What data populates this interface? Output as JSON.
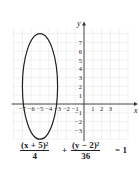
{
  "chart_data": {
    "type": "line",
    "title": "",
    "equation": "(x + 5)^2/4 + (y - 2)^2/36 = 1",
    "xlabel": "x",
    "ylabel": "y",
    "xlim": [
      -8,
      5
    ],
    "ylim": [
      -4,
      8
    ],
    "grid": true,
    "x_ticks": [
      -7,
      -6,
      -5,
      -4,
      -3,
      -2,
      -1,
      1,
      2,
      3
    ],
    "x_tick_labels": [
      "−7",
      "−6",
      "−5",
      "−4",
      "−3",
      "−2",
      "−1",
      "1",
      "2",
      "3"
    ],
    "y_ticks": [
      7,
      6,
      5,
      4,
      3,
      2,
      1,
      -1,
      -2,
      -3
    ],
    "y_tick_labels": [
      "7",
      "6",
      "5",
      "4",
      "3",
      "2",
      "1",
      "−1",
      "−2",
      "−3"
    ],
    "series": [
      {
        "name": "ellipse",
        "shape": "ellipse",
        "center": [
          -5,
          2
        ],
        "semi_axis_x": 2,
        "semi_axis_y": 6,
        "vertices": [
          [
            -5,
            8
          ],
          [
            -5,
            -4
          ]
        ],
        "co_vertices": [
          [
            -7,
            2
          ],
          [
            -3,
            2
          ]
        ],
        "color": "#222222"
      }
    ]
  },
  "equation": {
    "left_num": "(x + 5)²",
    "left_den": "4",
    "plus": "+",
    "right_num": "(y − 2)²",
    "right_den": "36",
    "equals": "= 1"
  },
  "axes": {
    "x_label": "x",
    "y_label": "y"
  },
  "colors": {
    "curve": "#222222",
    "axis": "#333333",
    "grid": "#c8c8c8",
    "text": "#222222"
  }
}
